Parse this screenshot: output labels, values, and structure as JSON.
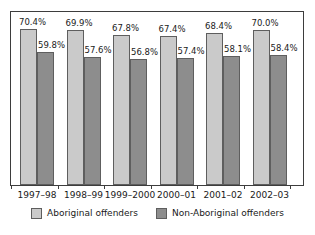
{
  "chart_data": {
    "type": "bar",
    "title": "",
    "subtitle": "",
    "xlabel": "",
    "ylabel": "",
    "ylim": [
      0,
      78
    ],
    "grid": false,
    "legend_position": "bottom",
    "categories": [
      "1997–98",
      "1998–99",
      "1999–2000",
      "2000–01",
      "2001–02",
      "2002–03"
    ],
    "series": [
      {
        "name": "Aboriginal offenders",
        "color": "#cacaca",
        "values": [
          70.4,
          69.9,
          67.8,
          67.4,
          68.4,
          70.0
        ],
        "labels": [
          "70.4%",
          "69.9%",
          "67.8%",
          "67.4%",
          "68.4%",
          "70.0%"
        ]
      },
      {
        "name": "Non-Aboriginal offenders",
        "color": "#8d8d8d",
        "values": [
          59.8,
          57.6,
          56.8,
          57.4,
          58.1,
          58.4
        ],
        "labels": [
          "59.8%",
          "57.6%",
          "56.8%",
          "57.4%",
          "58.1%",
          "58.4%"
        ]
      }
    ]
  },
  "legend": {
    "items": [
      {
        "label": "Aboriginal offenders",
        "swatch": "light"
      },
      {
        "label": "Non-Aboriginal offenders",
        "swatch": "dark"
      }
    ]
  },
  "colors": {
    "series_light": "#cacaca",
    "series_dark": "#8d8d8d",
    "frame": "#3d3d3d",
    "bar_outline": "#5e5e5e",
    "text": "#1a1a1a",
    "background": "#ffffff"
  }
}
